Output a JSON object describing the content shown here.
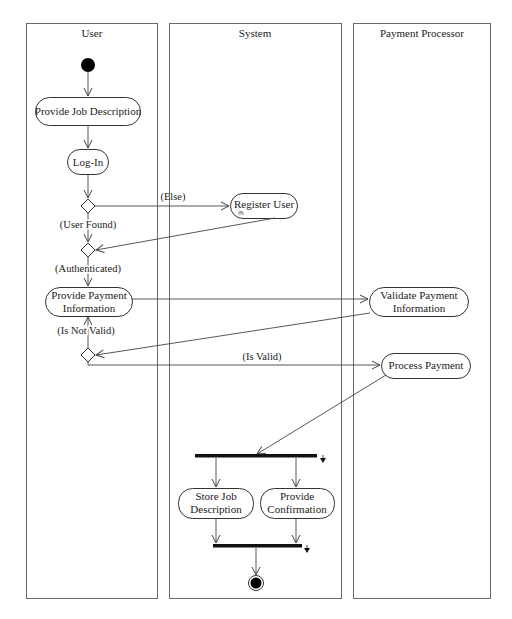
{
  "diagram": {
    "type": "UML activity diagram with swimlanes",
    "lanes": [
      {
        "id": "user",
        "title": "User"
      },
      {
        "id": "system",
        "title": "System"
      },
      {
        "id": "payment_processor",
        "title": "Payment Processor"
      }
    ],
    "actions": {
      "provide_job_description": {
        "lane": "User",
        "label": "Provide Job Description"
      },
      "log_in": {
        "lane": "User",
        "label": "Log-In"
      },
      "register_user": {
        "lane": "System",
        "label": "Register User",
        "has_subactivity_icon": true
      },
      "provide_payment_information": {
        "lane": "User",
        "line1": "Provide Payment",
        "line2": "Information"
      },
      "validate_payment_information": {
        "lane": "Payment Processor",
        "line1": "Validate Payment",
        "line2": "Information"
      },
      "process_payment": {
        "lane": "Payment Processor",
        "label": "Process Payment"
      },
      "store_job_description": {
        "lane": "System",
        "line1": "Store Job",
        "line2": "Description"
      },
      "provide_confirmation": {
        "lane": "System",
        "line1": "Provide",
        "line2": "Confirmation"
      }
    },
    "guards": {
      "else": "(Else)",
      "user_found": "(User Found)",
      "authenticated": "(Authenticated)",
      "is_not_valid": "(Is Not Valid)",
      "is_valid": "(Is Valid)"
    },
    "control_nodes": {
      "initial": "initial-node",
      "decisions": [
        "user-check",
        "merge-authenticated",
        "validity-check"
      ],
      "fork": "fork-bar",
      "join": "join-bar",
      "final": "activity-final-node"
    },
    "colors": {
      "lane_border": "#6b6b6b",
      "node_border": "#333333",
      "bar_fill": "#111111",
      "background": "#ffffff"
    }
  }
}
